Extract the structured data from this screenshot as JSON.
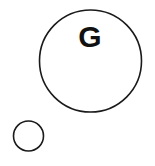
{
  "canvas": {
    "width": 155,
    "height": 166,
    "background_color": "#ffffff"
  },
  "diagram": {
    "title": "",
    "stroke_color": "#1a1a1a",
    "fill_color": "none",
    "label_color": "#111111",
    "shapes": [
      {
        "id": "large-circle",
        "kind": "circle",
        "label": "G",
        "cx": 90.5,
        "cy": 61,
        "r": 51,
        "stroke_width": 1.6,
        "label_x": 90,
        "label_y": 47,
        "label_font_size": 30
      },
      {
        "id": "small-circle",
        "kind": "circle",
        "label": "",
        "cx": 28.5,
        "cy": 136,
        "r": 15,
        "stroke_width": 1.6,
        "label_x": 28.5,
        "label_y": 141,
        "label_font_size": 12
      }
    ]
  }
}
